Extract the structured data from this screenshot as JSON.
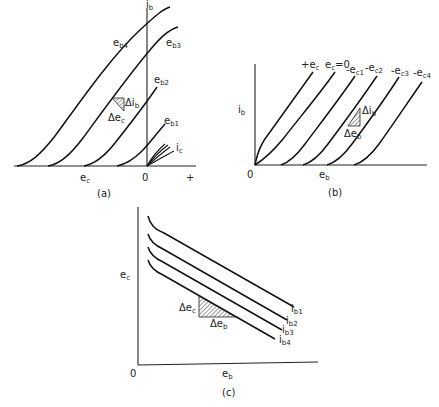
{
  "panels": {
    "a": {
      "caption": "(a)",
      "y_axis_label": "i",
      "y_axis_sub": "b",
      "x_axis_label": "e",
      "x_axis_sub": "c",
      "origin_label": "0",
      "plus_label": "+",
      "curves": [
        {
          "label": "e",
          "sub": "b4"
        },
        {
          "label": "e",
          "sub": "b3"
        },
        {
          "label": "e",
          "sub": "b2"
        },
        {
          "label": "e",
          "sub": "b1"
        }
      ],
      "ic_label": "i",
      "ic_sub": "c",
      "delta_y_label": "Δi",
      "delta_y_sub": "b",
      "delta_x_label": "Δe",
      "delta_x_sub": "c"
    },
    "b": {
      "caption": "(b)",
      "y_axis_label": "i",
      "y_axis_sub": "b",
      "x_axis_label": "e",
      "x_axis_sub": "b",
      "origin_label": "0",
      "curves": [
        {
          "label": "+e",
          "sub": "c"
        },
        {
          "label": "e",
          "sub": "c",
          "suffix": "=0"
        },
        {
          "label": "-e",
          "sub": "c1"
        },
        {
          "label": "-e",
          "sub": "c2"
        },
        {
          "label": "-e",
          "sub": "c3"
        },
        {
          "label": "-e",
          "sub": "c4"
        }
      ],
      "delta_y_label": "Δi",
      "delta_y_sub": "b",
      "delta_x_label": "Δe",
      "delta_x_sub": "b"
    },
    "c": {
      "caption": "(c)",
      "y_axis_label": "e",
      "y_axis_sub": "c",
      "x_axis_label": "e",
      "x_axis_sub": "b",
      "origin_label": "0",
      "curves": [
        {
          "label": "i",
          "sub": "b1"
        },
        {
          "label": "i",
          "sub": "b2"
        },
        {
          "label": "i",
          "sub": "b3"
        },
        {
          "label": "i",
          "sub": "b4"
        }
      ],
      "delta_y_label": "Δe",
      "delta_y_sub": "c",
      "delta_x_label": "Δe",
      "delta_x_sub": "b"
    }
  }
}
